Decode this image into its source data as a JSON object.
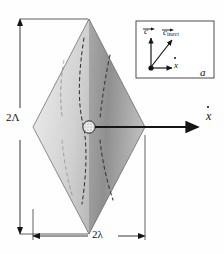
{
  "figure": {
    "panel_label": "a",
    "background_color": "#fefefe",
    "line_color": "#1a1a1a"
  },
  "diamond": {
    "name": "rhombus-mode-shape",
    "fill_light": "#e8e8e8",
    "fill_mid": "#c0c0c0",
    "fill_dark": "#8a8a8a",
    "edge_color": "#6e6e6e",
    "dashed_line_color": "#3c3c3c",
    "center_marker": "hatched-circle"
  },
  "dimensions": {
    "vertical": {
      "label": "2Λ",
      "name": "vertical-dimension-2Lambda"
    },
    "horizontal": {
      "label": "2λ",
      "name": "horizontal-dimension-2lambda"
    }
  },
  "axes": {
    "main_axis": {
      "label": "x",
      "accent": "dot",
      "name": "x-dot-axis-arrow"
    }
  },
  "inset": {
    "panel_label": "a",
    "vectors": [
      {
        "name": "vector-c",
        "label": "c",
        "accent": "arrow",
        "subscript": "",
        "direction": "up"
      },
      {
        "name": "vector-c-inert",
        "label": "c",
        "accent": "arrow",
        "subscript": "inert",
        "direction": "up-right"
      },
      {
        "name": "vector-x-dot",
        "label": "x",
        "accent": "dot",
        "subscript": "",
        "direction": "right"
      }
    ],
    "origin_marker": "filled-dot",
    "border_color": "#3a3a3a"
  }
}
